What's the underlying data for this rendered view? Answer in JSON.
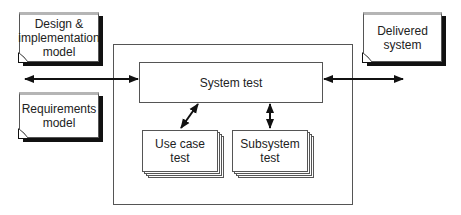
{
  "diagram": {
    "inputs": [
      {
        "id": "design",
        "label_lines": [
          "Design &",
          "implementation",
          "model"
        ]
      },
      {
        "id": "requirements",
        "label_lines": [
          "Requirements",
          "model"
        ]
      }
    ],
    "output": {
      "id": "delivered",
      "label_lines": [
        "Delivered",
        "system"
      ]
    },
    "system_test": {
      "label": "System test"
    },
    "sub_tests": [
      {
        "id": "use-case",
        "label_lines": [
          "Use case",
          "test"
        ]
      },
      {
        "id": "subsystem",
        "label_lines": [
          "Subsystem",
          "test"
        ]
      }
    ],
    "connections": [
      {
        "from": "inputs",
        "to": "system_test",
        "type": "bidirectional"
      },
      {
        "from": "system_test",
        "to": "delivered",
        "type": "bidirectional"
      },
      {
        "from": "system_test",
        "to": "use-case",
        "type": "bidirectional"
      },
      {
        "from": "system_test",
        "to": "subsystem",
        "type": "bidirectional"
      }
    ],
    "colors": {
      "line": "#111111",
      "border": "#555555",
      "doc_top": "#b5b5b5",
      "background": "#ffffff"
    }
  }
}
